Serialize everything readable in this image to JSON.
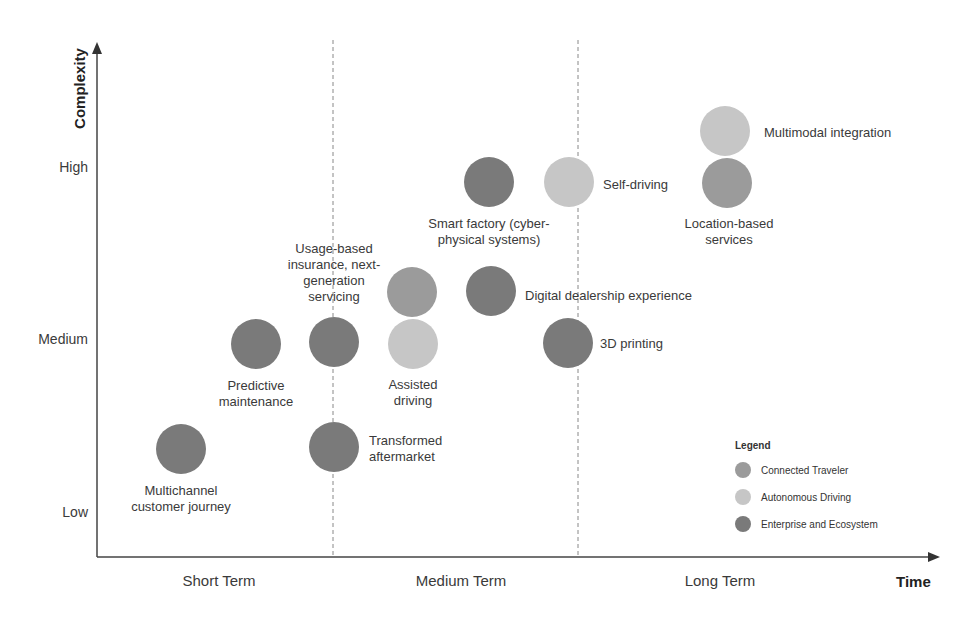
{
  "colors": {
    "connected_traveler": "#9b9b9b",
    "autonomous_driving": "#c6c6c6",
    "enterprise_ecosystem": "#7a7a7a",
    "axis": "#444444",
    "divider": "#888888"
  },
  "axes": {
    "y_title": "Complexity",
    "x_title": "Time",
    "y_ticks": [
      "High",
      "Medium",
      "Low"
    ],
    "x_ticks": [
      "Short Term",
      "Medium Term",
      "Long Term"
    ]
  },
  "legend": {
    "title": "Legend",
    "items": [
      {
        "label": "Connected Traveler",
        "key": "connected_traveler"
      },
      {
        "label": "Autonomous Driving",
        "key": "autonomous_driving"
      },
      {
        "label": "Enterprise and Ecosystem",
        "key": "enterprise_ecosystem"
      }
    ]
  },
  "nodes": [
    {
      "label": "Multichannel customer journey",
      "category": "enterprise_ecosystem",
      "cx": 181,
      "cy": 449,
      "time": "Short Term",
      "complexity": "Low"
    },
    {
      "label": "Predictive maintenance",
      "category": "enterprise_ecosystem",
      "cx": 256,
      "cy": 344,
      "time": "Short Term",
      "complexity": "Medium"
    },
    {
      "label": "Usage-based insurance, next-generation servicing",
      "category": "enterprise_ecosystem",
      "cx": 334,
      "cy": 342,
      "time": "Short/Medium Term",
      "complexity": "Medium"
    },
    {
      "label": "Transformed aftermarket",
      "category": "enterprise_ecosystem",
      "cx": 334,
      "cy": 447,
      "time": "Short/Medium Term",
      "complexity": "Low"
    },
    {
      "label": "Connected Traveler node (unlabeled)",
      "category": "connected_traveler",
      "cx": 412,
      "cy": 292,
      "time": "Medium Term",
      "complexity": "Medium"
    },
    {
      "label": "Assisted driving",
      "category": "autonomous_driving",
      "cx": 413,
      "cy": 344,
      "time": "Medium Term",
      "complexity": "Medium"
    },
    {
      "label": "Smart factory (cyber-physical systems)",
      "category": "enterprise_ecosystem",
      "cx": 489,
      "cy": 182,
      "time": "Medium Term",
      "complexity": "High"
    },
    {
      "label": "Digital dealership experience",
      "category": "enterprise_ecosystem",
      "cx": 491,
      "cy": 291,
      "time": "Medium Term",
      "complexity": "Medium"
    },
    {
      "label": "Self-driving",
      "category": "autonomous_driving",
      "cx": 569,
      "cy": 182,
      "time": "Medium/Long Term",
      "complexity": "High"
    },
    {
      "label": "3D printing",
      "category": "enterprise_ecosystem",
      "cx": 568,
      "cy": 343,
      "time": "Medium/Long Term",
      "complexity": "Medium"
    },
    {
      "label": "Multimodal integration",
      "category": "autonomous_driving",
      "cx": 725,
      "cy": 131,
      "time": "Long Term",
      "complexity": "High"
    },
    {
      "label": "Location-based services",
      "category": "connected_traveler",
      "cx": 727,
      "cy": 183,
      "time": "Long Term",
      "complexity": "High"
    }
  ],
  "labels": {
    "multichannel": [
      "Multichannel",
      "customer journey"
    ],
    "predictive": [
      "Predictive",
      "maintenance"
    ],
    "usage": [
      "Usage-based",
      "insurance, next-",
      "generation",
      "servicing"
    ],
    "transformed": [
      "Transformed",
      "aftermarket"
    ],
    "assisted": [
      "Assisted",
      "driving"
    ],
    "smart": [
      "Smart factory (cyber-",
      "physical systems)"
    ],
    "digital": "Digital dealership experience",
    "self": "Self-driving",
    "printing": "3D printing",
    "multimodal": "Multimodal integration",
    "location": [
      "Location-based",
      "services"
    ]
  }
}
